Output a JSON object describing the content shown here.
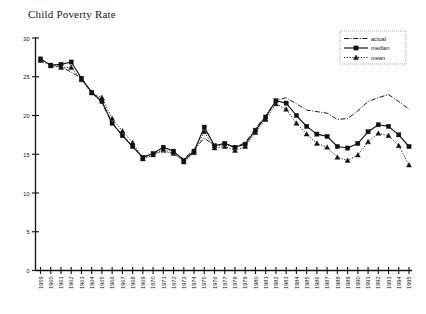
{
  "chart_data": {
    "type": "line",
    "title": "Child Poverty Rate",
    "xlabel": "",
    "ylabel": "",
    "grid": false,
    "legend_position": "top-right",
    "xlim": [
      1959,
      1995
    ],
    "ylim": [
      0,
      30
    ],
    "yticks": [
      0,
      5,
      10,
      15,
      20,
      25,
      30
    ],
    "categories": [
      "1959",
      "1960",
      "1961",
      "1962",
      "1963",
      "1964",
      "1965",
      "1966",
      "1967",
      "1968",
      "1969",
      "1970",
      "1971",
      "1972",
      "1973",
      "1974",
      "1975",
      "1976",
      "1977",
      "1978",
      "1979",
      "1980",
      "1981",
      "1982",
      "1983",
      "1984",
      "1985",
      "1986",
      "1987",
      "1988",
      "1989",
      "1990",
      "1991",
      "1992",
      "1993",
      "1994",
      "1995"
    ],
    "series": [
      {
        "name": "actual",
        "style": "dash-dot",
        "marker": "none",
        "color": "#1a1a1a",
        "values": [
          27.3,
          26.5,
          26.3,
          25.6,
          24.8,
          23.0,
          21.6,
          19.0,
          17.5,
          16.0,
          14.6,
          15.1,
          15.3,
          15.1,
          14.4,
          15.6,
          17.1,
          16.1,
          16.2,
          15.9,
          16.5,
          18.3,
          20.0,
          21.9,
          22.3,
          21.5,
          20.7,
          20.5,
          20.3,
          19.5,
          19.6,
          20.6,
          21.8,
          22.3,
          22.7,
          21.8,
          20.8
        ]
      },
      {
        "name": "median",
        "style": "solid",
        "marker": "square",
        "color": "#111111",
        "values": [
          27.3,
          26.5,
          26.6,
          26.9,
          24.8,
          23.0,
          21.8,
          19.0,
          17.4,
          16.0,
          14.6,
          15.1,
          15.9,
          15.4,
          14.2,
          15.4,
          18.5,
          16.1,
          16.4,
          15.9,
          16.3,
          18.1,
          19.8,
          21.9,
          21.6,
          20.0,
          18.6,
          17.6,
          17.3,
          16.0,
          15.8,
          16.4,
          17.9,
          18.8,
          18.6,
          17.5,
          16.0
        ]
      },
      {
        "name": "mean",
        "style": "dotted",
        "marker": "triangle",
        "color": "#111111",
        "values": [
          27.1,
          26.4,
          26.2,
          26.2,
          24.6,
          22.9,
          22.3,
          19.6,
          18.0,
          16.5,
          14.4,
          14.9,
          15.6,
          15.1,
          14.0,
          15.2,
          17.9,
          15.8,
          16.0,
          15.5,
          16.0,
          17.8,
          19.5,
          21.5,
          20.8,
          19.0,
          17.6,
          16.4,
          15.9,
          14.6,
          14.2,
          14.9,
          16.6,
          17.7,
          17.4,
          16.1,
          13.6
        ]
      }
    ]
  },
  "legend": {
    "entries": [
      {
        "label": "actual"
      },
      {
        "label": "median"
      },
      {
        "label": "mean"
      }
    ]
  }
}
